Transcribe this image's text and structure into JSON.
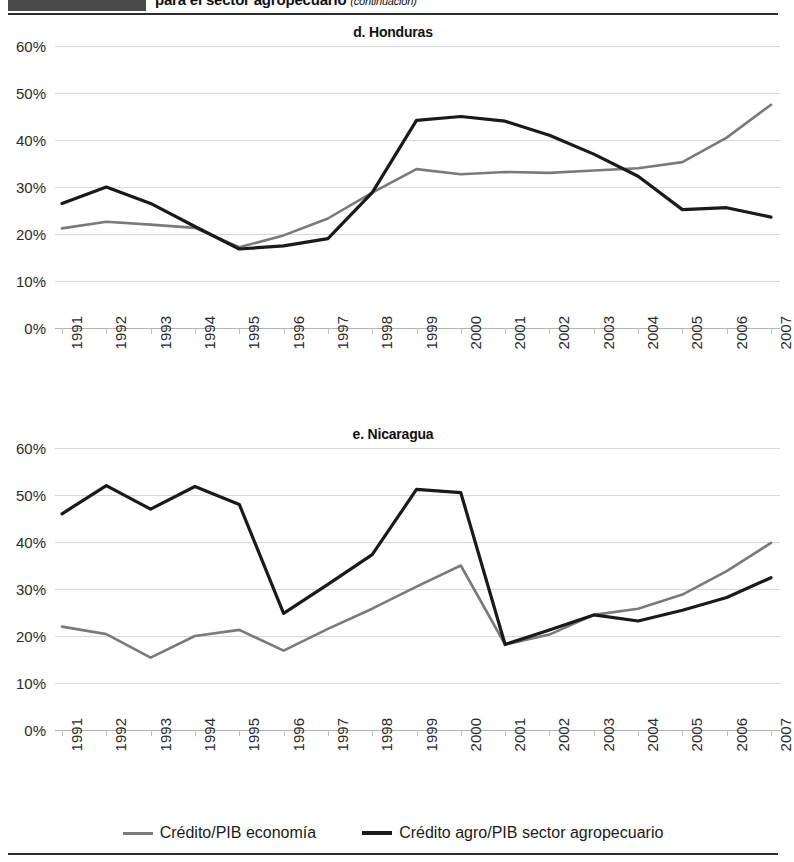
{
  "header": {
    "title": "para el sector agropecuario",
    "continuation": "(continuación)",
    "swatch_color": "#4a4a4a"
  },
  "legend": {
    "items": [
      {
        "label": "Crédito/PIB economía",
        "color": "#7a7a7a",
        "key": "credito_pib_economia"
      },
      {
        "label": "Crédito agro/PIB sector agropecuario",
        "color": "#1a1a1a",
        "key": "credito_agro_pib_agro"
      }
    ]
  },
  "charts": [
    {
      "id": "honduras",
      "title": "d. Honduras"
    },
    {
      "id": "nicaragua",
      "title": "e. Nicaragua"
    }
  ],
  "chart_data": [
    {
      "type": "line",
      "title": "d. Honduras",
      "xlabel": "",
      "ylabel": "",
      "ylim": [
        0,
        60
      ],
      "yticks": [
        0,
        10,
        20,
        30,
        40,
        50,
        60
      ],
      "ytick_labels": [
        "0%",
        "10%",
        "20%",
        "30%",
        "40%",
        "50%",
        "60%"
      ],
      "grid": true,
      "legend_position": "bottom-shared",
      "categories": [
        "1991",
        "1992",
        "1993",
        "1994",
        "1995",
        "1996",
        "1997",
        "1998",
        "1999",
        "2000",
        "2001",
        "2002",
        "2003",
        "2004",
        "2005",
        "2006",
        "2007"
      ],
      "series": [
        {
          "name": "Crédito/PIB economía",
          "color": "#7a7a7a",
          "values": [
            21.2,
            22.6,
            22.0,
            21.3,
            17.2,
            19.7,
            23.3,
            28.8,
            33.8,
            32.7,
            33.2,
            33.0,
            33.5,
            34.0,
            35.3,
            40.5,
            47.5
          ]
        },
        {
          "name": "Crédito agro/PIB sector agropecuario",
          "color": "#1a1a1a",
          "values": [
            26.5,
            30.0,
            26.5,
            21.6,
            16.8,
            17.5,
            19.0,
            28.8,
            44.2,
            45.0,
            44.0,
            41.0,
            37.0,
            32.3,
            25.2,
            25.6,
            23.6
          ]
        }
      ]
    },
    {
      "type": "line",
      "title": "e. Nicaragua",
      "xlabel": "",
      "ylabel": "",
      "ylim": [
        0,
        60
      ],
      "yticks": [
        0,
        10,
        20,
        30,
        40,
        50,
        60
      ],
      "ytick_labels": [
        "0%",
        "10%",
        "20%",
        "30%",
        "40%",
        "50%",
        "60%"
      ],
      "grid": true,
      "legend_position": "bottom-shared",
      "categories": [
        "1991",
        "1992",
        "1993",
        "1994",
        "1995",
        "1996",
        "1997",
        "1998",
        "1999",
        "2000",
        "2001",
        "2002",
        "2003",
        "2004",
        "2005",
        "2006",
        "2007"
      ],
      "series": [
        {
          "name": "Crédito/PIB economía",
          "color": "#7a7a7a",
          "values": [
            22.0,
            20.4,
            15.4,
            20.0,
            21.3,
            16.9,
            21.5,
            25.8,
            30.5,
            35.0,
            18.2,
            20.3,
            24.5,
            25.8,
            28.8,
            33.8,
            39.8
          ]
        },
        {
          "name": "Crédito agro/PIB sector agropecuario",
          "color": "#1a1a1a",
          "values": [
            46.0,
            52.0,
            47.0,
            51.8,
            48.0,
            24.8,
            31.0,
            37.3,
            51.2,
            50.5,
            18.2,
            21.3,
            24.5,
            23.2,
            25.5,
            28.2,
            32.4
          ]
        }
      ]
    }
  ]
}
